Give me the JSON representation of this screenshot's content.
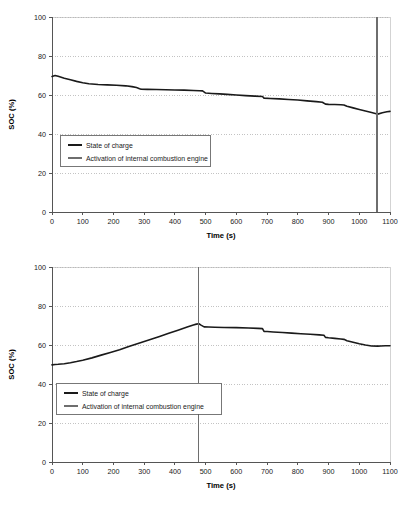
{
  "figure": {
    "name": "soc-profiles-figure",
    "background": "#ffffff"
  },
  "colors": {
    "series_soc": "#1a1a1a",
    "series_ice": "#6e6e6e",
    "grid": "#b4b4b4",
    "axis": "#555555",
    "plot_border": "#c8c8c8",
    "text": "#1a1a1a"
  },
  "chart_data": [
    {
      "id": "chart-top",
      "type": "line",
      "title": "",
      "xlabel": "Time (s)",
      "ylabel": "SOC (%)",
      "xlim": [
        0,
        1100
      ],
      "ylim": [
        0,
        100
      ],
      "xticks": [
        0,
        100,
        200,
        300,
        400,
        500,
        600,
        700,
        800,
        900,
        1000,
        1100
      ],
      "xtick_labels": [
        "0",
        "100",
        "200",
        "300",
        "400",
        "500",
        "600",
        "700",
        "800",
        "900",
        "1000",
        "1100"
      ],
      "yticks": [
        0,
        20,
        40,
        60,
        80,
        100
      ],
      "ytick_labels": [
        "0",
        "20",
        "40",
        "60",
        "80",
        "100"
      ],
      "grid": "horizontal-dotted",
      "legend_position": "center-left",
      "legend": [
        {
          "label": "State of charge",
          "kind": "series-soc"
        },
        {
          "label": "Activation of internal combustion engine",
          "kind": "series-ice"
        }
      ],
      "series": [
        {
          "name": "State of charge",
          "x": [
            0,
            10,
            20,
            40,
            60,
            80,
            100,
            120,
            150,
            180,
            210,
            240,
            260,
            275,
            285,
            290,
            310,
            340,
            370,
            400,
            430,
            460,
            480,
            490,
            500,
            520,
            545,
            570,
            600,
            630,
            660,
            685,
            690,
            710,
            740,
            770,
            800,
            830,
            860,
            880,
            890,
            900,
            920,
            940,
            950,
            960,
            980,
            1000,
            1020,
            1040,
            1058,
            1060,
            1075,
            1090,
            1100
          ],
          "y": [
            69.5,
            70.0,
            69.6,
            68.6,
            67.8,
            67.0,
            66.3,
            65.8,
            65.4,
            65.2,
            65.0,
            64.7,
            64.3,
            63.8,
            63.2,
            63.0,
            62.9,
            62.8,
            62.7,
            62.6,
            62.5,
            62.3,
            62.2,
            62.1,
            61.0,
            60.8,
            60.6,
            60.3,
            60.0,
            59.7,
            59.4,
            59.2,
            58.4,
            58.2,
            58.0,
            57.7,
            57.4,
            57.0,
            56.6,
            56.3,
            55.3,
            55.2,
            55.1,
            55.0,
            54.9,
            54.2,
            53.4,
            52.6,
            51.8,
            51.0,
            50.3,
            50.2,
            50.9,
            51.4,
            51.6
          ]
        },
        {
          "name": "Activation of internal combustion engine",
          "type": "vertical-line",
          "x": 1058,
          "y_from": 0,
          "y_to": 100
        }
      ]
    },
    {
      "id": "chart-bot",
      "type": "line",
      "title": "",
      "xlabel": "Time (s)",
      "ylabel": "SOC (%)",
      "xlim": [
        0,
        1100
      ],
      "ylim": [
        0,
        100
      ],
      "xticks": [
        0,
        100,
        200,
        300,
        400,
        500,
        600,
        700,
        800,
        900,
        1000,
        1100
      ],
      "xtick_labels": [
        "0",
        "100",
        "200",
        "300",
        "400",
        "500",
        "600",
        "700",
        "800",
        "900",
        "1000",
        "1100"
      ],
      "yticks": [
        0,
        20,
        40,
        60,
        80,
        100
      ],
      "ytick_labels": [
        "0",
        "20",
        "40",
        "60",
        "80",
        "100"
      ],
      "grid": "horizontal-dotted",
      "legend_position": "center-left",
      "legend": [
        {
          "label": "State of charge",
          "kind": "series-soc"
        },
        {
          "label": "Activation of internal combustion engine",
          "kind": "series-ice"
        }
      ],
      "series": [
        {
          "name": "State of charge",
          "x": [
            0,
            10,
            20,
            40,
            60,
            80,
            100,
            130,
            160,
            190,
            220,
            250,
            270,
            280,
            300,
            320,
            350,
            380,
            410,
            440,
            460,
            470,
            478,
            485,
            495,
            510,
            530,
            560,
            600,
            640,
            670,
            685,
            690,
            700,
            720,
            750,
            780,
            810,
            840,
            870,
            885,
            890,
            900,
            920,
            940,
            950,
            960,
            980,
            1000,
            1020,
            1040,
            1060,
            1070,
            1085,
            1100
          ],
          "y": [
            49.8,
            50.0,
            50.1,
            50.4,
            50.9,
            51.5,
            52.2,
            53.4,
            54.8,
            56.2,
            57.6,
            59.2,
            60.3,
            60.8,
            61.8,
            62.8,
            64.4,
            66.0,
            67.6,
            69.2,
            70.3,
            70.7,
            70.9,
            70.2,
            69.3,
            69.2,
            69.1,
            69.0,
            68.9,
            68.7,
            68.5,
            68.4,
            67.0,
            66.9,
            66.7,
            66.4,
            66.1,
            65.8,
            65.5,
            65.2,
            65.0,
            63.9,
            63.7,
            63.4,
            63.1,
            62.9,
            62.2,
            61.4,
            60.6,
            60.0,
            59.5,
            59.4,
            59.5,
            59.6,
            59.6
          ]
        },
        {
          "name": "Activation of internal combustion engine",
          "type": "vertical-line",
          "x": 476,
          "y_from": 0,
          "y_to": 100
        }
      ]
    }
  ]
}
